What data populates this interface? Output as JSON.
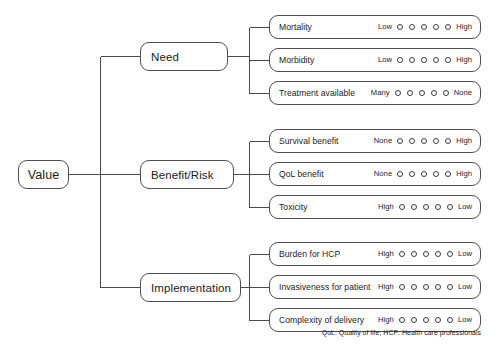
{
  "diagram": {
    "root": {
      "label": "Value"
    },
    "branches": [
      {
        "label": "Need",
        "criteria": [
          {
            "label": "Mortality",
            "scale_low_label": "Low",
            "scale_high_label": "High",
            "options": 5,
            "selected": null
          },
          {
            "label": "Morbidity",
            "scale_low_label": "Low",
            "scale_high_label": "High",
            "options": 5,
            "selected": null
          },
          {
            "label": "Treatment available",
            "scale_low_label": "Many",
            "scale_high_label": "None",
            "options": 5,
            "selected": null
          }
        ]
      },
      {
        "label": "Benefit/Risk",
        "criteria": [
          {
            "label": "Survival benefit",
            "scale_low_label": "None",
            "scale_high_label": "High",
            "options": 5,
            "selected": null
          },
          {
            "label": "QoL benefit",
            "scale_low_label": "None",
            "scale_high_label": "High",
            "options": 5,
            "selected": null
          },
          {
            "label": "Toxicity",
            "scale_low_label": "High",
            "scale_high_label": "Low",
            "options": 5,
            "selected": null
          }
        ]
      },
      {
        "label": "Implementation",
        "criteria": [
          {
            "label": "Burden for HCP",
            "scale_low_label": "High",
            "scale_high_label": "Low",
            "options": 5,
            "selected": null
          },
          {
            "label": "Invasiveness for patient",
            "scale_low_label": "High",
            "scale_high_label": "Low",
            "options": 5,
            "selected": null
          },
          {
            "label": "Complexity of delivery",
            "scale_low_label": "High",
            "scale_high_label": "Low",
            "options": 5,
            "selected": null
          }
        ]
      }
    ],
    "footnote": "QoL: Quality of life; HCP: Health care professionals",
    "colors": {
      "background": "#ffffff",
      "line": "#4a4a4a",
      "border": "#4e4e4e",
      "text": "#1b1b1b"
    }
  }
}
